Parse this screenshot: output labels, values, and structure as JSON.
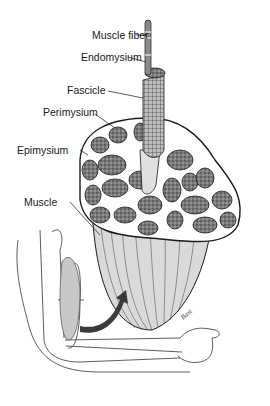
{
  "diagram": {
    "labels": [
      {
        "id": "muscle-fiber",
        "text": "Muscle fiber"
      },
      {
        "id": "endomysium",
        "text": "Endomysium"
      },
      {
        "id": "fascicle",
        "text": "Fascicle"
      },
      {
        "id": "perimysium",
        "text": "Perimysium"
      },
      {
        "id": "epimysium",
        "text": "Epimysium"
      },
      {
        "id": "muscle",
        "text": "Muscle"
      }
    ],
    "signature": "Bast",
    "colors": {
      "line": "#1a1a1a",
      "fascicle_fill": "#6e6e6e",
      "muscle_fill": "#d9d9d9",
      "arrow": "#3a3a3a",
      "background": "#ffffff"
    }
  }
}
